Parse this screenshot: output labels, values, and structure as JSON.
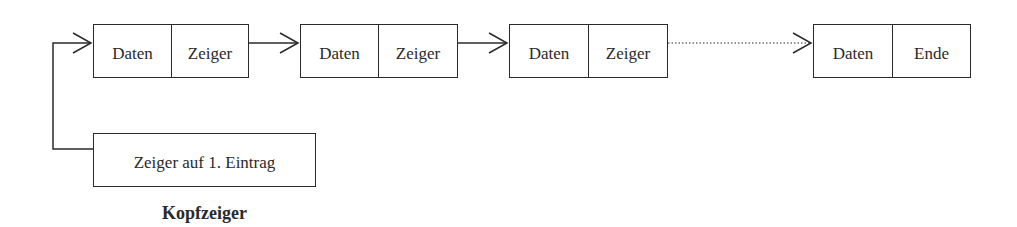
{
  "nodes": [
    {
      "data": "Daten",
      "pointer": "Zeiger"
    },
    {
      "data": "Daten",
      "pointer": "Zeiger"
    },
    {
      "data": "Daten",
      "pointer": "Zeiger"
    },
    {
      "data": "Daten",
      "pointer": "Ende"
    }
  ],
  "head": {
    "box_text": "Zeiger auf 1. Eintrag",
    "label": "Kopfzeiger"
  },
  "colors": {
    "stroke": "#2a2a2a",
    "background": "#ffffff"
  }
}
